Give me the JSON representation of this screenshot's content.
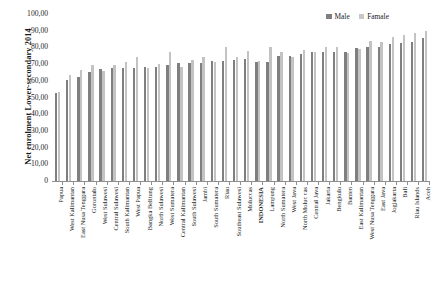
{
  "chart_data": {
    "type": "bar",
    "title": "",
    "xlabel": "",
    "ylabel": "Net enrolment Lower-secondary 2014",
    "ylim": [
      0,
      100
    ],
    "ytick_labels": [
      "100,00",
      "90,00",
      "80,00",
      "70,00",
      "60,00",
      "50,00",
      "40,00",
      "30,00",
      "20,00",
      "10,00",
      "0"
    ],
    "ytick_values": [
      100,
      90,
      80,
      70,
      60,
      50,
      40,
      30,
      20,
      10,
      0
    ],
    "grid": false,
    "legend_position": "top-right",
    "categories": [
      "Papua",
      "West Kalimantan",
      "East Nusa Tenggara",
      "Gorontalo",
      "West Sulawesi",
      "Central Sulawesi",
      "South Kalimantan",
      "West Papua",
      "Bangka Belitung",
      "North Sulawesi",
      "West Sumatera",
      "Central Kalimantan",
      "South Sulawesi",
      "Jambi",
      "South Sumatera",
      "Riau",
      "Southeast Sulawesi",
      "Moluccas",
      "INDONESIA",
      "Lampung",
      "North Sumatera",
      "West Java",
      "North Moluc cas",
      "Central Java",
      "Jakarta",
      "Bengkulu",
      "Banten",
      "East Kalimantan",
      "West Nusa Tenggara",
      "East Java",
      "Jogjakarta",
      "Bali",
      "Riau Islands",
      "Aceh"
    ],
    "emphasis_category": "INDONESIA",
    "series": [
      {
        "name": "Male",
        "color": "#7f7f7f",
        "values": [
          53.0,
          60.5,
          62.0,
          65.5,
          67.0,
          67.5,
          67.5,
          67.5,
          68.0,
          68.0,
          69.5,
          70.5,
          70.5,
          70.5,
          72.0,
          72.0,
          72.5,
          73.0,
          71.0,
          71.0,
          75.0,
          75.0,
          76.0,
          77.0,
          77.0,
          77.5,
          77.5,
          79.5,
          80.0,
          80.0,
          82.0,
          82.5,
          83.5,
          85.5
        ]
      },
      {
        "name": "Famale",
        "color": "#c3c3c3",
        "values": [
          53.5,
          63.5,
          66.5,
          69.5,
          66.0,
          69.5,
          71.0,
          74.5,
          67.5,
          70.0,
          77.5,
          68.5,
          72.5,
          74.0,
          71.5,
          80.5,
          74.5,
          78.0,
          72.0,
          80.5,
          77.0,
          74.5,
          78.5,
          77.0,
          80.0,
          80.0,
          76.5,
          79.0,
          84.0,
          83.0,
          86.0,
          87.5,
          88.5,
          90.0
        ]
      }
    ]
  },
  "legend": {
    "items": [
      {
        "label": "Male"
      },
      {
        "label": "Famale"
      }
    ]
  },
  "corner": {
    "mark": ""
  }
}
